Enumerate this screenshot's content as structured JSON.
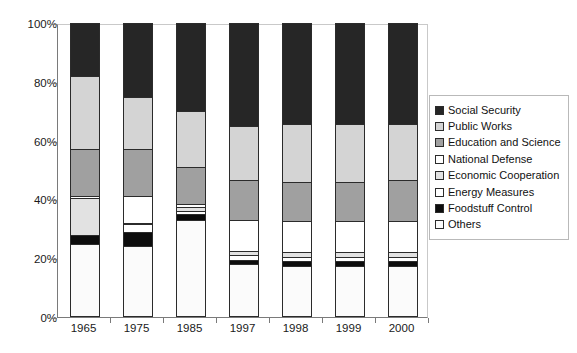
{
  "chart_data": {
    "type": "bar",
    "subtype": "stacked-100-percent",
    "title": "",
    "xlabel": "",
    "ylabel": "",
    "ylim": [
      0,
      100
    ],
    "ytick_labels": [
      "0%",
      "20%",
      "40%",
      "60%",
      "80%",
      "100%"
    ],
    "ytick_values": [
      0,
      20,
      40,
      60,
      80,
      100
    ],
    "grid": false,
    "legend_position": "right",
    "categories": [
      "1965",
      "1975",
      "1985",
      "1997",
      "1998",
      "1999",
      "2000"
    ],
    "series": [
      {
        "name": "Social Security",
        "color": "#262626",
        "values": [
          18.0,
          25.0,
          30.0,
          35.0,
          34.5,
          34.5,
          34.5
        ]
      },
      {
        "name": "Public Works",
        "color": "#d4d4d4",
        "values": [
          25.0,
          18.0,
          19.0,
          18.5,
          19.5,
          19.5,
          19.0
        ]
      },
      {
        "name": "Education and Science",
        "color": "#a0a0a0",
        "values": [
          16.0,
          16.0,
          12.5,
          13.5,
          13.5,
          13.5,
          14.0
        ]
      },
      {
        "name": "National Defense",
        "color": "#ffffff",
        "values": [
          0.5,
          9.0,
          1.0,
          10.5,
          10.5,
          10.5,
          10.5
        ]
      },
      {
        "name": "Economic Cooperation",
        "color": "#e2e2e2",
        "values": [
          12.5,
          0.5,
          1.5,
          1.5,
          1.5,
          1.5,
          1.5
        ]
      },
      {
        "name": "Energy Measures",
        "color": "#ffffff",
        "values": [
          0.0,
          2.5,
          1.0,
          1.5,
          1.5,
          1.5,
          1.5
        ]
      },
      {
        "name": "Foodstuff Control",
        "color": "#0d0d0d",
        "values": [
          3.0,
          5.0,
          2.0,
          1.5,
          1.5,
          1.5,
          1.5
        ]
      },
      {
        "name": "Others",
        "color": "#fbfbfb",
        "values": [
          25.0,
          24.0,
          33.0,
          18.0,
          17.5,
          17.5,
          17.5
        ]
      }
    ],
    "stack_order_bottom_to_top": [
      "Others",
      "Foodstuff Control",
      "Energy Measures",
      "Economic Cooperation",
      "National Defense",
      "Education and Science",
      "Public Works",
      "Social Security"
    ]
  },
  "legend": {
    "items": [
      {
        "label": "Social Security",
        "swatch": "social-security"
      },
      {
        "label": "Public Works",
        "swatch": "public-works"
      },
      {
        "label": "Education and Science",
        "swatch": "education-and-science"
      },
      {
        "label": "National Defense",
        "swatch": "national-defense"
      },
      {
        "label": "Economic Cooperation",
        "swatch": "economic-cooperation"
      },
      {
        "label": "Energy Measures",
        "swatch": "energy-measures"
      },
      {
        "label": "Foodstuff Control",
        "swatch": "foodstuff-control"
      },
      {
        "label": "Others",
        "swatch": "others"
      }
    ]
  }
}
